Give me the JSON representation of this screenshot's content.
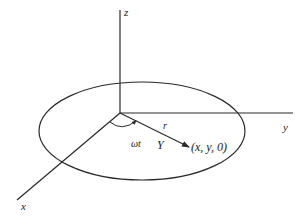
{
  "diagram": {
    "type": "3d-coordinate-circle",
    "axes": {
      "z": {
        "label": "z"
      },
      "y": {
        "label": "y"
      },
      "x": {
        "label": "x"
      }
    },
    "radius_label": "r",
    "angle_label": "ωt",
    "vector_label": "Y",
    "point_label": "(x, y, 0)",
    "colors": {
      "stroke": "#2a2a2a",
      "background": "#ffffff"
    }
  }
}
